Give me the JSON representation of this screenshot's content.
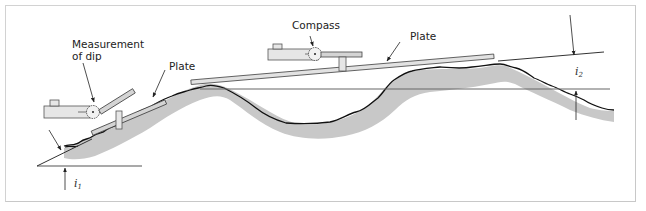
{
  "figure": {
    "labels": {
      "measurement_of_dip_line1": "Measurement",
      "measurement_of_dip_line2": "of dip",
      "plate_small": "Plate",
      "compass": "Compass",
      "plate_large": "Plate",
      "angle1_symbol": "i",
      "angle1_sub": "1",
      "angle2_symbol": "i",
      "angle2_sub": "2"
    },
    "colors": {
      "frame": "#d2d2d2",
      "terrain_fill": "#c8c8c8",
      "terrain_outline": "#111111",
      "plate_fill": "#d4d4d4",
      "compass_fill": "#e6e6e6",
      "line": "#333333",
      "horizontal_ref": "#666666"
    }
  }
}
